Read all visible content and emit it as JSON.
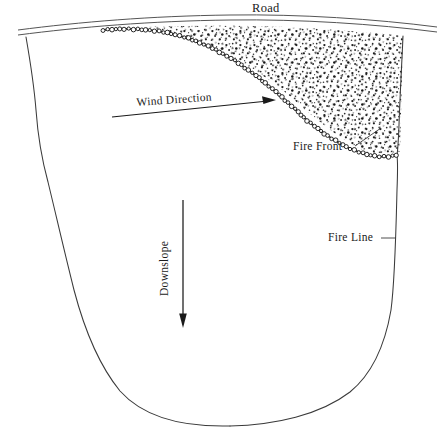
{
  "figure": {
    "type": "line-diagram",
    "width": 439,
    "height": 438,
    "background_color": "#ffffff",
    "ink_color": "#1a1a1a"
  },
  "labels": {
    "road": "Road",
    "wind_direction": "Wind Direction",
    "fire_front": "Fire Front",
    "fire_line": "Fire Line",
    "downslope": "Downslope"
  },
  "elements": {
    "road": {
      "name": "road",
      "description": "two parallel curved lines arcing across the top of the figure",
      "stroke_color": "#555555"
    },
    "burn_area": {
      "name": "burned-area",
      "description": "stippled region between the road and the fire front",
      "fill_pattern": "stipple-dots",
      "dot_color": "#222222"
    },
    "fire_front": {
      "name": "fire-front",
      "description": "beaded chain of small circles marking the advancing fire edge",
      "stroke_color": "#111111"
    },
    "fire_line": {
      "name": "fire-line",
      "description": "thin outline enclosing the fire perimeter",
      "stroke_color": "#3a3a3a"
    },
    "wind_arrow": {
      "name": "wind-direction-arrow",
      "direction": "left-to-right, tilted slightly upward",
      "stroke_color": "#1a1a1a"
    },
    "downslope_arrow": {
      "name": "downslope-arrow",
      "direction": "downward",
      "stroke_color": "#1a1a1a"
    },
    "leaders": {
      "fire_front_leader": "diagonal leader from the Fire Front text up-right to the beaded front",
      "fire_line_leader": "horizontal leader from the Fire Line text right to the perimeter outline"
    }
  }
}
